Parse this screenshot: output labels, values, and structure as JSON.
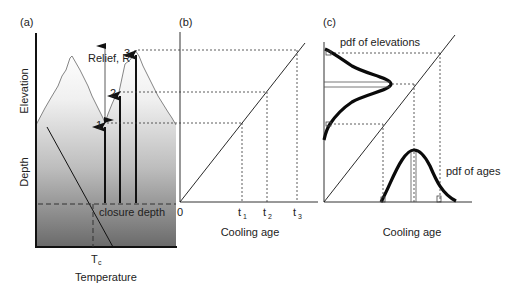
{
  "panels": {
    "a": {
      "label": "(a)",
      "y_label_top": "Elevation",
      "y_label_bottom": "Depth",
      "x_label": "Temperature",
      "tc_label": "T",
      "tc_sub": "c",
      "relief_label": "Relief, R",
      "closure_label": "closure depth",
      "points": [
        "1",
        "2",
        "3"
      ]
    },
    "b": {
      "label": "(b)",
      "origin": "0",
      "ticks": [
        {
          "main": "t",
          "sub": "1"
        },
        {
          "main": "t",
          "sub": "2"
        },
        {
          "main": "t",
          "sub": "3"
        }
      ],
      "x_label": "Cooling age"
    },
    "c": {
      "label": "(c)",
      "pdf_elev_label": "pdf of elevations",
      "pdf_age_label": "pdf of ages",
      "x_label": "Cooling age"
    }
  },
  "colors": {
    "line": "#1a1a1a",
    "grad_top": "#ffffff",
    "grad_bottom": "#6a6a6a"
  }
}
